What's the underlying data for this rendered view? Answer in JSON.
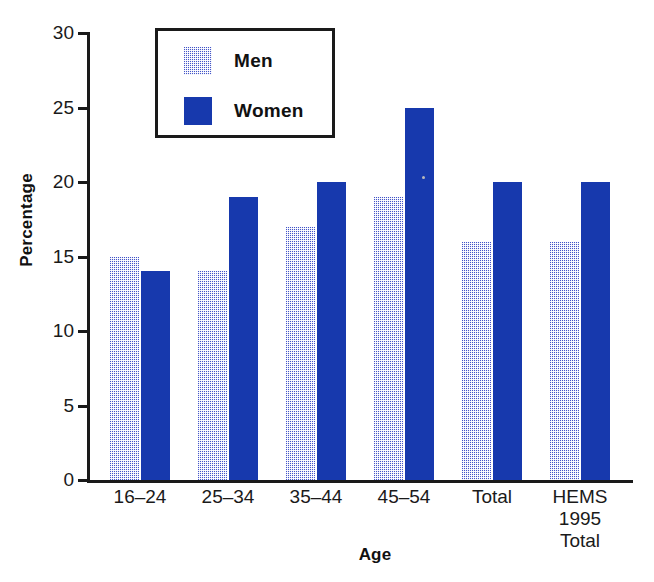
{
  "chart_data": {
    "type": "bar",
    "title": "",
    "xlabel": "Age",
    "ylabel": "Percentage",
    "ylim": [
      0,
      30
    ],
    "yticks": [
      0,
      5,
      10,
      15,
      20,
      25,
      30
    ],
    "ytick_labels": [
      "0",
      "5",
      "10",
      "15",
      "20",
      "25",
      "30"
    ],
    "grid": false,
    "legend_position": "top-center-inside",
    "categories": [
      "16–24",
      "25–34",
      "35–44",
      "45–54",
      "Total",
      "HEMS\n1995\nTotal"
    ],
    "category_labels_display": [
      "16–24",
      "25–34",
      "35–44",
      "45–54",
      "Total",
      "HEMS\n1995\nTotal"
    ],
    "series": [
      {
        "name": "Men",
        "color": "#4455c8",
        "fill": "dither-checkerboard",
        "values": [
          15,
          14,
          17,
          19,
          16,
          16
        ]
      },
      {
        "name": "Women",
        "color": "#1739ad",
        "fill": "solid",
        "values": [
          14,
          19,
          20,
          25,
          20,
          20
        ]
      }
    ]
  },
  "legend": {
    "items": [
      {
        "label": "Men",
        "swatch": "men-pattern-swatch"
      },
      {
        "label": "Women",
        "swatch": "women-solid-swatch"
      }
    ]
  },
  "axes": {
    "y_title": "Percentage",
    "x_title": "Age"
  },
  "colors": {
    "men_bar": "#4455c8",
    "women_bar": "#1739ad",
    "axis": "#1a1a1a",
    "background": "#ffffff"
  }
}
